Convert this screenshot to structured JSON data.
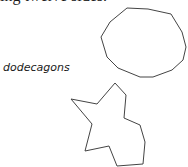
{
  "document": {
    "top_text": "ing twelve sides.",
    "figure_label": "dodecagons"
  },
  "figure": {
    "stroke_color": "#444444",
    "shapes": [
      {
        "name": "regular-dodecagon",
        "points": "127,8 148,9 171,14 182,32 186,47 183,60 172,70 153,77 140,77 118,68 107,57 101,37 110,22"
      },
      {
        "name": "irregular-dodecagon",
        "points": "115,83 126,95 124,118 140,125 145,142 143,164 117,166 109,146 85,151 92,124 71,99 97,104"
      }
    ]
  }
}
